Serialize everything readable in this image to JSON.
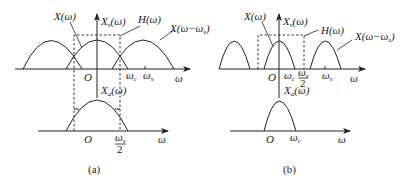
{
  "figure": {
    "panels": [
      {
        "id": "a",
        "caption": "(a)",
        "top": {
          "labels": {
            "X": "X(ω)",
            "Xs_main": "X",
            "Xs_sub": "s",
            "Xs_tail": "(ω)",
            "H": "H(ω)",
            "Xshift_main": "X(ω−ω",
            "Xshift_sub": "s",
            "Xshift_tail": ")",
            "origin": "O",
            "wc_main": "ω",
            "wc_sub": "c",
            "ws_main": "ω",
            "ws_sub": "s",
            "axis": "ω"
          }
        },
        "bottom": {
          "labels": {
            "Xa_main": "X",
            "Xa_sub": "a",
            "Xa_tail": "(ω)",
            "origin": "O",
            "half_num_main": "ω",
            "half_num_sub": "s",
            "half_den": "2",
            "axis": "ω"
          }
        }
      },
      {
        "id": "b",
        "caption": "(b)",
        "top": {
          "labels": {
            "X": "X(ω)",
            "Xs_main": "X",
            "Xs_sub": "s",
            "Xs_tail": "(ω)",
            "H": "H(ω)",
            "Xshift_main": "X(ω−ω",
            "Xshift_sub": "s",
            "Xshift_tail": ")",
            "origin": "O",
            "wc_main": "ω",
            "wc_sub": "c",
            "half_num_main": "ω",
            "half_num_sub": "s",
            "half_den": "2",
            "ws_main": "ω",
            "ws_sub": "s",
            "axis": "ω"
          }
        },
        "bottom": {
          "labels": {
            "Xa_main": "X",
            "Xa_sub": "a",
            "Xa_tail": "(ω)",
            "origin": "O",
            "wc_main": "ω",
            "wc_sub": "c",
            "axis": "ω"
          }
        }
      }
    ]
  }
}
